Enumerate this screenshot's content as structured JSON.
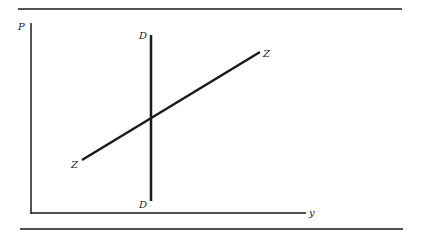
{
  "diagram": {
    "type": "supply-demand-style",
    "axes": {
      "vertical_label": "P",
      "horizontal_label": "y"
    },
    "curves": [
      {
        "name": "D",
        "label_top": "D",
        "label_bottom": "D",
        "orientation": "vertical"
      },
      {
        "name": "Z",
        "label_start": "Z",
        "label_end": "Z",
        "orientation": "upward-sloping"
      }
    ],
    "colors": {
      "ink": "#1a1a1a",
      "background": "#ffffff"
    }
  }
}
